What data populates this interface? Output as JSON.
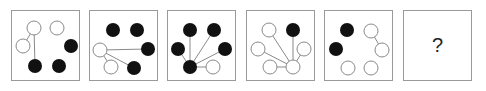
{
  "puzzle": {
    "panel_count": 6,
    "colors": {
      "border": "#9a9a9a",
      "filled": "#111111",
      "open_stroke": "#8a8a8a",
      "line": "#8a8a8a"
    },
    "panels": [
      {
        "left": 11,
        "circles": [
          {
            "x": 22,
            "y": 17,
            "fill": "open"
          },
          {
            "x": 45,
            "y": 17,
            "fill": "open"
          },
          {
            "x": 11,
            "y": 35,
            "fill": "open"
          },
          {
            "x": 59,
            "y": 35,
            "fill": "filled"
          },
          {
            "x": 23,
            "y": 55,
            "fill": "filled"
          },
          {
            "x": 47,
            "y": 55,
            "fill": "filled"
          }
        ],
        "lines": [
          [
            0,
            2
          ],
          [
            0,
            4
          ]
        ]
      },
      {
        "left": 89,
        "circles": [
          {
            "x": 23,
            "y": 19,
            "fill": "filled"
          },
          {
            "x": 47,
            "y": 19,
            "fill": "filled"
          },
          {
            "x": 10,
            "y": 39,
            "fill": "open"
          },
          {
            "x": 58,
            "y": 38,
            "fill": "filled"
          },
          {
            "x": 21,
            "y": 56,
            "fill": "open"
          },
          {
            "x": 44,
            "y": 57,
            "fill": "filled"
          }
        ],
        "lines": [
          [
            2,
            3
          ],
          [
            2,
            5
          ],
          [
            2,
            4
          ]
        ]
      },
      {
        "left": 167,
        "circles": [
          {
            "x": 22,
            "y": 19,
            "fill": "filled"
          },
          {
            "x": 46,
            "y": 19,
            "fill": "filled"
          },
          {
            "x": 10,
            "y": 38,
            "fill": "filled"
          },
          {
            "x": 57,
            "y": 38,
            "fill": "filled"
          },
          {
            "x": 22,
            "y": 56,
            "fill": "filled"
          },
          {
            "x": 45,
            "y": 56,
            "fill": "open"
          }
        ],
        "lines": [
          [
            4,
            0
          ],
          [
            4,
            1
          ],
          [
            4,
            2
          ],
          [
            4,
            3
          ],
          [
            4,
            5
          ]
        ]
      },
      {
        "left": 246,
        "circles": [
          {
            "x": 22,
            "y": 19,
            "fill": "open"
          },
          {
            "x": 46,
            "y": 19,
            "fill": "filled"
          },
          {
            "x": 11,
            "y": 38,
            "fill": "open"
          },
          {
            "x": 57,
            "y": 38,
            "fill": "open"
          },
          {
            "x": 23,
            "y": 56,
            "fill": "open"
          },
          {
            "x": 46,
            "y": 56,
            "fill": "open"
          }
        ],
        "lines": [
          [
            5,
            0
          ],
          [
            5,
            1
          ],
          [
            5,
            2
          ],
          [
            5,
            3
          ],
          [
            5,
            4
          ]
        ]
      },
      {
        "left": 324,
        "circles": [
          {
            "x": 22,
            "y": 19,
            "fill": "filled"
          },
          {
            "x": 46,
            "y": 20,
            "fill": "open"
          },
          {
            "x": 11,
            "y": 38,
            "fill": "filled"
          },
          {
            "x": 57,
            "y": 39,
            "fill": "open"
          },
          {
            "x": 23,
            "y": 57,
            "fill": "open"
          },
          {
            "x": 46,
            "y": 57,
            "fill": "open"
          }
        ],
        "lines": [
          [
            1,
            3
          ]
        ]
      },
      {
        "left": 403,
        "question_mark": "?"
      }
    ]
  }
}
